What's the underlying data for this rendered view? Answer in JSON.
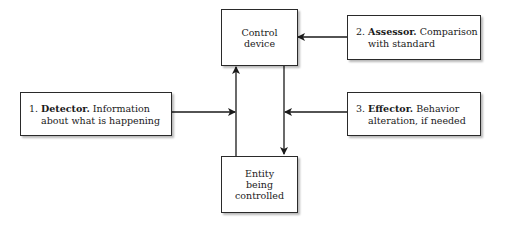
{
  "diagram": {
    "control_device": {
      "lines": [
        "Control",
        "device"
      ]
    },
    "entity": {
      "lines": [
        "Entity",
        "being",
        "controlled"
      ]
    },
    "detector": {
      "number": "1.",
      "title": "Detector.",
      "rest": "Information",
      "line2": "about what is happening"
    },
    "assessor": {
      "number": "2.",
      "title": "Assessor.",
      "rest": "Comparison",
      "line2": "with standard"
    },
    "effector": {
      "number": "3.",
      "title": "Effector.",
      "rest": "Behavior",
      "line2": "alteration, if needed"
    }
  },
  "colors": {
    "line": "#1a1a1a",
    "box_border": "#2a2a2a",
    "background": "#ffffff"
  }
}
